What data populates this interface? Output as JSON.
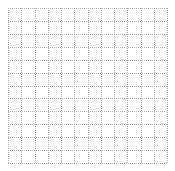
{
  "canvas": {
    "width": 175,
    "height": 171,
    "background_color": "#ffffff"
  },
  "grid": {
    "name": "dotted-grid",
    "origin_x": 8,
    "origin_y": 8,
    "width": 159,
    "height": 155,
    "columns": 12,
    "rows": 12,
    "cell_width": 13.25,
    "cell_height": 12.92,
    "line_color": "#b8b8c0",
    "line_style": "dotted",
    "line_width": 1,
    "vertical_line_positions": [
      0,
      13.25,
      26.5,
      39.75,
      53,
      66.25,
      79.5,
      92.75,
      106,
      119.25,
      132.5,
      145.75,
      159
    ],
    "horizontal_line_positions": [
      0,
      12.92,
      25.83,
      38.75,
      51.67,
      64.58,
      77.5,
      90.42,
      103.33,
      116.25,
      129.17,
      142.08,
      155
    ]
  },
  "chart_data": {
    "type": "scatter",
    "title": "",
    "subtitle": "",
    "xlabel": "",
    "ylabel": "",
    "series": [],
    "categories": [],
    "x": [],
    "values": [],
    "xtick_labels": [],
    "ytick_labels": [],
    "legend": [],
    "legend_position": "none",
    "grid": true,
    "xlim": [
      0,
      12
    ],
    "ylim": [
      0,
      12
    ],
    "annotations": [],
    "note": "Empty grid / graph-paper plot area with dotted gridlines; no data marks, axes labels, ticks or legend are rendered."
  }
}
